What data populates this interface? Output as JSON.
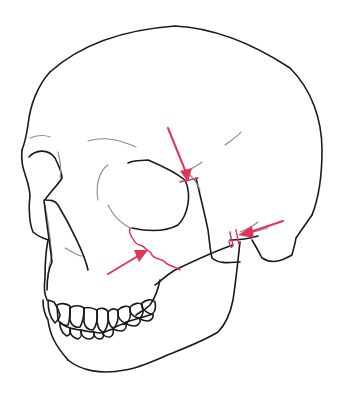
{
  "figure": {
    "colors": {
      "background": "#ffffff",
      "outline": "#1a1a1a",
      "detail": "#8a8a8a",
      "fracture_marker": "#e0345a"
    },
    "annotations": [
      {
        "id": "arrow-frontozygomatic",
        "target": "lateral orbital rim",
        "direction": "down"
      },
      {
        "id": "arrow-zygomaticomaxillary",
        "target": "infraorbital rim / maxilla",
        "direction": "up-right"
      },
      {
        "id": "arrow-zygomatic-arch",
        "target": "zygomatic arch",
        "direction": "left"
      }
    ]
  }
}
